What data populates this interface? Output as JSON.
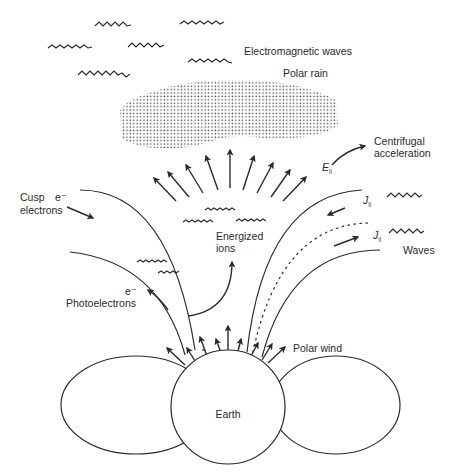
{
  "diagram": {
    "title": "",
    "labels": {
      "electromagnetic_waves": "Electromagnetic waves",
      "polar_rain": "Polar rain",
      "centrifugal_line1": "Centrifugal",
      "centrifugal_line2": "acceleration",
      "e_parallel": "E",
      "parallel_sub": "||",
      "j_parallel_1": "J",
      "j_parallel_2": "J",
      "waves": "Waves",
      "cusp_line1": "Cusp",
      "cusp_line2": "electrons",
      "cusp_e": "e⁻",
      "energized_line1": "Energized",
      "energized_line2": "ions",
      "photo_e": "e⁻",
      "photoelectrons": "Photoelectrons",
      "polar_wind": "Polar wind",
      "earth": "Earth"
    },
    "nodes": [
      {
        "id": "earth",
        "shape": "circle",
        "label": "Earth"
      },
      {
        "id": "left-lobe",
        "shape": "ellipse"
      },
      {
        "id": "right-lobe",
        "shape": "ellipse"
      },
      {
        "id": "polar-rain-region",
        "shape": "stippled-cloud",
        "label": "Polar rain"
      }
    ],
    "edges": [
      {
        "from": "earth",
        "to": "space",
        "label": "Polar wind",
        "style": "arrows-up"
      },
      {
        "from": "polar-cap",
        "to": "upper",
        "label": "Centrifugal acceleration",
        "style": "arrows-fan"
      },
      {
        "from": "cusp",
        "to": "earth",
        "label": "Cusp electrons e⁻"
      },
      {
        "from": "earth",
        "to": "outward",
        "label": "Photoelectrons e⁻"
      },
      {
        "from": "earth",
        "to": "up",
        "label": "Energized ions"
      },
      {
        "label": "J||",
        "direction": "inward"
      },
      {
        "label": "J||",
        "direction": "outward"
      }
    ]
  }
}
